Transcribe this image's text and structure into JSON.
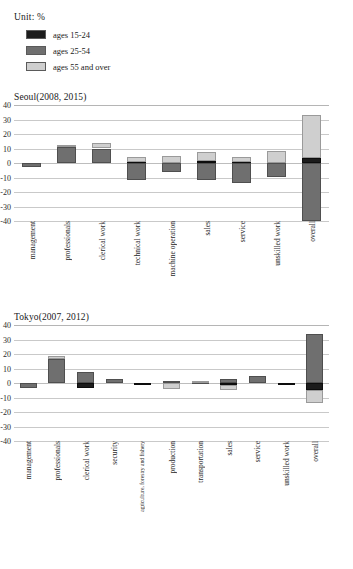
{
  "unit_label": "Unit: %",
  "legend": {
    "items": [
      {
        "label": "ages 15-24",
        "color": "#1c1c1c",
        "key": "young"
      },
      {
        "label": "ages 25-54",
        "color": "#6f6f6f",
        "key": "prime"
      },
      {
        "label": "ages 55 and over",
        "color": "#cfcfcf",
        "key": "senior"
      }
    ]
  },
  "figure_caption": "",
  "chart_data": [
    {
      "id": "seoul",
      "type": "bar",
      "title": "Seoul(2008, 2015)",
      "xlabel": "",
      "ylabel": "",
      "unit": "%",
      "ylim": [
        -40,
        40
      ],
      "yticks": [
        40,
        30,
        20,
        10,
        0,
        -10,
        -20,
        -30,
        -40
      ],
      "grid": true,
      "stacked": true,
      "legend_position": "top-left",
      "categories": [
        "management",
        "professionals",
        "clerical work",
        "technical work",
        "machine operation",
        "sales",
        "service",
        "unskilled work",
        "overall"
      ],
      "series": [
        {
          "name": "ages 15-24",
          "values": [
            0,
            0,
            0,
            0.5,
            0,
            1.5,
            0.5,
            0,
            3.5
          ]
        },
        {
          "name": "ages 25-54",
          "values": [
            -3,
            11,
            10,
            -11.5,
            -6.5,
            -11.5,
            -14,
            -9.5,
            -40
          ]
        },
        {
          "name": "ages 55 and over",
          "values": [
            0,
            1.5,
            3.5,
            3.5,
            5,
            6,
            3.5,
            8.5,
            29.5
          ]
        }
      ]
    },
    {
      "id": "tokyo",
      "type": "bar",
      "title": "Tokyo(2007, 2012)",
      "xlabel": "",
      "ylabel": "",
      "unit": "%",
      "ylim": [
        -40,
        40
      ],
      "yticks": [
        40,
        30,
        20,
        10,
        0,
        -10,
        -20,
        -30,
        -40
      ],
      "grid": true,
      "stacked": true,
      "legend_position": "top-left",
      "categories": [
        "management",
        "professionals",
        "clerical work",
        "security",
        "agriculture, forestry and fishery",
        "production",
        "transportation",
        "sales",
        "service",
        "unskilled work",
        "overall"
      ],
      "series": [
        {
          "name": "ages 15-24",
          "values": [
            0,
            0,
            -3.5,
            0,
            -0.6,
            0,
            0,
            -1.5,
            0,
            -0.8,
            -5
          ]
        },
        {
          "name": "ages 25-54",
          "values": [
            -3.5,
            16.5,
            7.5,
            2.5,
            0,
            1.5,
            0.8,
            2.5,
            5,
            0,
            34
          ]
        },
        {
          "name": "ages 55 and over",
          "values": [
            0,
            2,
            0,
            0,
            0,
            -4,
            0.6,
            -3,
            0,
            0,
            -9
          ]
        }
      ]
    }
  ]
}
